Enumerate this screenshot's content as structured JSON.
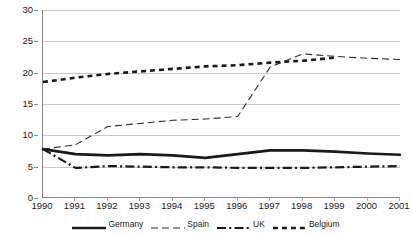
{
  "chart_data": {
    "type": "line",
    "title": "",
    "subtitle": "",
    "xlabel": "",
    "ylabel": "",
    "categories": [
      "1990",
      "1991",
      "1992",
      "1993",
      "1994",
      "1995",
      "1996",
      "1997",
      "1998",
      "1999",
      "2000",
      "2001"
    ],
    "ylim": [
      0,
      30
    ],
    "y_ticks": [
      0,
      5,
      10,
      15,
      20,
      25,
      30
    ],
    "grid": true,
    "grid_axis": "y",
    "legend_position": "bottom",
    "series": [
      {
        "name": "Germany",
        "style": "solid",
        "color": "#1a1a1a",
        "width": 2.6,
        "values": [
          7.8,
          7.0,
          6.8,
          7.0,
          6.8,
          6.4,
          7.0,
          7.6,
          7.6,
          7.4,
          7.1,
          6.9
        ]
      },
      {
        "name": "Spain",
        "style": "dashed",
        "color": "#2b2b2b",
        "width": 1.1,
        "values": [
          7.8,
          8.5,
          11.4,
          11.9,
          12.4,
          12.6,
          13.0,
          20.9,
          23.0,
          22.6,
          22.3,
          22.1
        ]
      },
      {
        "name": "UK",
        "style": "dashdot",
        "color": "#1a1a1a",
        "width": 2.2,
        "values": [
          7.8,
          4.8,
          5.1,
          5.0,
          4.9,
          4.9,
          4.8,
          4.8,
          4.8,
          4.9,
          5.0,
          5.1
        ]
      },
      {
        "name": "Belgium",
        "style": "dotted",
        "color": "#1a1a1a",
        "width": 2.6,
        "values": [
          18.5,
          19.2,
          19.8,
          20.2,
          20.6,
          21.0,
          21.2,
          21.6,
          21.9,
          22.4,
          null,
          null
        ]
      }
    ]
  },
  "legend": {
    "entries": [
      {
        "label": "Germany"
      },
      {
        "label": "Spain"
      },
      {
        "label": "UK"
      },
      {
        "label": "Belgium"
      }
    ]
  }
}
